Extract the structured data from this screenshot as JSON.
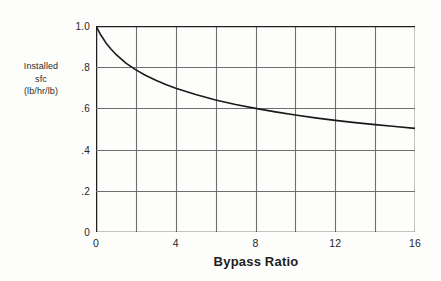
{
  "chart_data": {
    "type": "line",
    "title": "",
    "xlabel": "Bypass Ratio",
    "ylabel_lines": [
      "Installed",
      "sfc",
      "(lb/hr/lb)"
    ],
    "ylabel": "Installed sfc (lb/hr/lb)",
    "xlim": [
      0,
      16
    ],
    "ylim": [
      0,
      1.0
    ],
    "grid": true,
    "legend": "none",
    "xticks": [
      {
        "value": 0,
        "label": "0"
      },
      {
        "value": 4,
        "label": "4"
      },
      {
        "value": 8,
        "label": "8"
      },
      {
        "value": 12,
        "label": "12"
      },
      {
        "value": 16,
        "label": "16"
      }
    ],
    "x_gridlines": [
      0,
      2,
      4,
      6,
      8,
      10,
      12,
      14,
      16
    ],
    "yticks": [
      {
        "value": 1.0,
        "label": "1.0"
      },
      {
        "value": 0.8,
        "label": ".8"
      },
      {
        "value": 0.6,
        "label": ".6"
      },
      {
        "value": 0.4,
        "label": ".4"
      },
      {
        "value": 0.2,
        "label": ".2"
      },
      {
        "value": 0.0,
        "label": "0"
      }
    ],
    "y_gridlines": [
      0.0,
      0.2,
      0.4,
      0.6,
      0.8,
      1.0
    ],
    "series": [
      {
        "name": "Installed sfc",
        "x": [
          0.0,
          0.25,
          0.5,
          0.75,
          1.0,
          1.5,
          2.0,
          2.5,
          3.0,
          3.5,
          4.0,
          5.0,
          6.0,
          7.0,
          8.0,
          9.0,
          10.0,
          11.0,
          12.0,
          13.0,
          14.0,
          15.0,
          16.0
        ],
        "y": [
          1.0,
          0.955,
          0.918,
          0.888,
          0.862,
          0.82,
          0.787,
          0.76,
          0.737,
          0.716,
          0.698,
          0.667,
          0.641,
          0.619,
          0.6,
          0.583,
          0.568,
          0.554,
          0.542,
          0.531,
          0.521,
          0.512,
          0.503
        ]
      }
    ]
  },
  "colors": {
    "background": "#fdfdfb",
    "grid": "#6f6f6f",
    "axis": "#1f1f1f",
    "curve": "#1a1a1a",
    "text": "#262626"
  }
}
